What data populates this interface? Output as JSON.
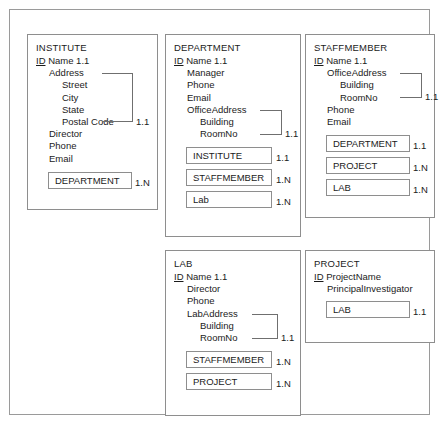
{
  "diagram": {
    "colors": {
      "background": "#ffffff",
      "frame_line": "#9a9a9a",
      "entity_line": "#8e8e8e",
      "bracket_line": "#6f6f6f",
      "text": "#1b1b1b"
    },
    "entities": [
      {
        "name": "INSTITUTE",
        "attributes": [
          {
            "text": "ID",
            "key": true,
            "indent": 0,
            "suffix": "Name 1.1"
          },
          {
            "text": "Address",
            "key": false,
            "indent": 1,
            "suffix": ""
          },
          {
            "text": "Street",
            "key": false,
            "indent": 2,
            "suffix": ""
          },
          {
            "text": "City",
            "key": false,
            "indent": 2,
            "suffix": ""
          },
          {
            "text": "State",
            "key": false,
            "indent": 2,
            "suffix": ""
          },
          {
            "text": "Postal Code",
            "key": false,
            "indent": 2,
            "suffix": ""
          },
          {
            "text": "Director",
            "key": false,
            "indent": 1,
            "suffix": ""
          },
          {
            "text": "Phone",
            "key": false,
            "indent": 1,
            "suffix": ""
          },
          {
            "text": "Email",
            "key": false,
            "indent": 1,
            "suffix": ""
          }
        ],
        "composite": {
          "label": "Address",
          "last": "Postal Code",
          "cardinality": "1.1"
        },
        "references": [
          {
            "label": "DEPARTMENT",
            "cardinality": "1.N"
          }
        ]
      },
      {
        "name": "DEPARTMENT",
        "attributes": [
          {
            "text": "ID",
            "key": true,
            "indent": 0,
            "suffix": "Name 1.1"
          },
          {
            "text": "Manager",
            "key": false,
            "indent": 1,
            "suffix": ""
          },
          {
            "text": "Phone",
            "key": false,
            "indent": 1,
            "suffix": ""
          },
          {
            "text": "Email",
            "key": false,
            "indent": 1,
            "suffix": ""
          },
          {
            "text": "OfficeAddress",
            "key": false,
            "indent": 1,
            "suffix": ""
          },
          {
            "text": "Building",
            "key": false,
            "indent": 2,
            "suffix": ""
          },
          {
            "text": "RoomNo",
            "key": false,
            "indent": 2,
            "suffix": ""
          }
        ],
        "composite": {
          "label": "OfficeAddress",
          "last": "RoomNo",
          "cardinality": "1.1"
        },
        "references": [
          {
            "label": "INSTITUTE",
            "cardinality": "1.1"
          },
          {
            "label": "STAFFMEMBER",
            "cardinality": "1.N"
          },
          {
            "label": "Lab",
            "cardinality": "1.N"
          }
        ]
      },
      {
        "name": "STAFFMEMBER",
        "attributes": [
          {
            "text": "ID",
            "key": true,
            "indent": 0,
            "suffix": "Name 1.1"
          },
          {
            "text": "OfficeAddress",
            "key": false,
            "indent": 1,
            "suffix": ""
          },
          {
            "text": "Building",
            "key": false,
            "indent": 2,
            "suffix": ""
          },
          {
            "text": "RoomNo",
            "key": false,
            "indent": 2,
            "suffix": ""
          },
          {
            "text": "Phone",
            "key": false,
            "indent": 1,
            "suffix": ""
          },
          {
            "text": "Email",
            "key": false,
            "indent": 1,
            "suffix": ""
          }
        ],
        "composite": {
          "label": "OfficeAddress",
          "last": "RoomNo",
          "cardinality": "1.1"
        },
        "references": [
          {
            "label": "DEPARTMENT",
            "cardinality": "1.1"
          },
          {
            "label": "PROJECT",
            "cardinality": "1.N"
          },
          {
            "label": "LAB",
            "cardinality": "1.N"
          }
        ]
      },
      {
        "name": "LAB",
        "attributes": [
          {
            "text": "ID",
            "key": true,
            "indent": 0,
            "suffix": "Name 1.1"
          },
          {
            "text": "Director",
            "key": false,
            "indent": 1,
            "suffix": ""
          },
          {
            "text": "Phone",
            "key": false,
            "indent": 1,
            "suffix": ""
          },
          {
            "text": "LabAddress",
            "key": false,
            "indent": 1,
            "suffix": ""
          },
          {
            "text": "Building",
            "key": false,
            "indent": 2,
            "suffix": ""
          },
          {
            "text": "RoomNo",
            "key": false,
            "indent": 2,
            "suffix": ""
          }
        ],
        "composite": {
          "label": "LabAddress",
          "last": "RoomNo",
          "cardinality": "1.1"
        },
        "references": [
          {
            "label": "STAFFMEMBER",
            "cardinality": "1.N"
          },
          {
            "label": "PROJECT",
            "cardinality": "1.N"
          }
        ]
      },
      {
        "name": "PROJECT",
        "attributes": [
          {
            "text": "ID",
            "key": true,
            "indent": 0,
            "suffix": "ProjectName"
          },
          {
            "text": "PrincipalInvestigator",
            "key": false,
            "indent": 1,
            "suffix": ""
          }
        ],
        "composite": null,
        "references": [
          {
            "label": "LAB",
            "cardinality": "1.1"
          }
        ]
      }
    ]
  }
}
